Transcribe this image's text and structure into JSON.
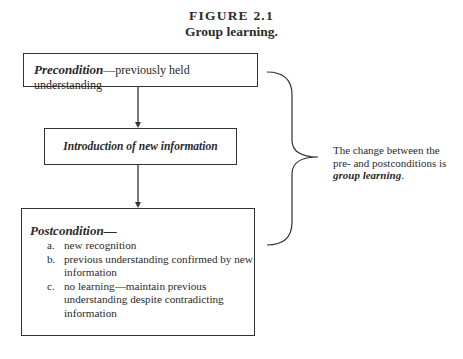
{
  "figure": {
    "label": "FIGURE 2.1",
    "title": "Group learning."
  },
  "boxes": {
    "precondition": {
      "term": "Precondition",
      "description": "—previously held understanding"
    },
    "introduction": {
      "text": "Introduction of new information"
    },
    "postcondition": {
      "term": "Postcondition—",
      "items": [
        {
          "marker": "a.",
          "text": "new recognition"
        },
        {
          "marker": "b.",
          "text": "previous understanding confirmed by new information"
        },
        {
          "marker": "c.",
          "text": "no learning—maintain previous understanding despite contradicting information"
        }
      ]
    }
  },
  "annotation": {
    "prefix": "The change between the pre- and postconditions is ",
    "emphasis": "group learning",
    "suffix": "."
  },
  "colors": {
    "line": "#333333",
    "text": "#2a2a2a",
    "background": "#ffffff"
  }
}
